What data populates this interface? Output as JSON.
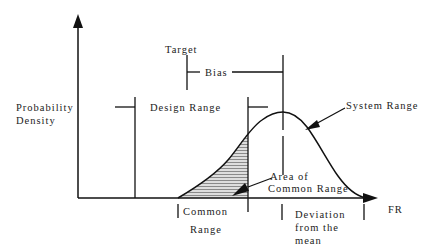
{
  "diagram": {
    "y_axis_label_line1": "Probability",
    "y_axis_label_line2": "Density",
    "x_axis_label": "FR",
    "target_label": "Target",
    "bias_label": "Bias",
    "design_range_label": "Design Range",
    "system_range_label": "System Range",
    "area_label_line1": "Area of",
    "area_label_line2": "Common Range",
    "common_range_line1": "Common",
    "common_range_line2": "Range",
    "deviation_line1": "Deviation",
    "deviation_line2": "from the",
    "deviation_line3": "mean"
  },
  "colors": {
    "line": "#111111",
    "hatch": "#9a9a9a",
    "hatch_bg": "#d8d8d8"
  }
}
